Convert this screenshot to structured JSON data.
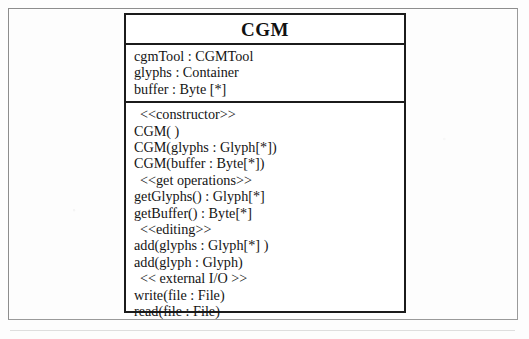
{
  "diagram": {
    "type": "uml-class-diagram",
    "class": {
      "name": "CGM",
      "attributes": [
        "cgmTool : CGMTool",
        "glyphs : Container",
        "buffer : Byte [*]"
      ],
      "operations": [
        {
          "kind": "stereotype",
          "text": "<<constructor>>"
        },
        {
          "kind": "operation",
          "text": "CGM( )"
        },
        {
          "kind": "operation",
          "text": "CGM(glyphs : Glyph[*])"
        },
        {
          "kind": "operation",
          "text": "CGM(buffer : Byte[*])"
        },
        {
          "kind": "stereotype",
          "text": "<<get operations>>"
        },
        {
          "kind": "operation",
          "text": "getGlyphs() : Glyph[*]"
        },
        {
          "kind": "operation",
          "text": "getBuffer() : Byte[*]"
        },
        {
          "kind": "stereotype",
          "text": "<<editing>>"
        },
        {
          "kind": "operation",
          "text": "add(glyphs : Glyph[*] )"
        },
        {
          "kind": "operation",
          "text": "add(glyph : Glyph)"
        },
        {
          "kind": "stereotype",
          "text": "<< external I/O >>"
        },
        {
          "kind": "operation",
          "text": "write(file : File)"
        },
        {
          "kind": "operation",
          "text": "read(file : File)"
        }
      ]
    },
    "colors": {
      "border": "#1b1b1b",
      "page_border": "#8d8d8d",
      "text": "#141414",
      "background": "#ffffff"
    }
  }
}
